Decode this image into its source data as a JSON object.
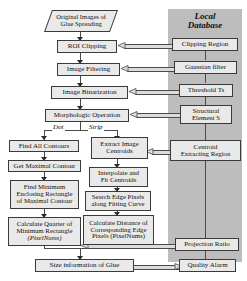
{
  "diagram": {
    "title_hidden": "",
    "panel": {
      "label_line1": "Local",
      "label_line2": "Database"
    },
    "branch_labels": {
      "left": "Dot",
      "right": "Strip"
    },
    "main_flow": [
      {
        "id": "original-images",
        "shape": "parallelogram",
        "lines": [
          "Original Images of",
          "Glue Spreading"
        ]
      },
      {
        "id": "roi-clipping",
        "shape": "process",
        "lines": [
          "ROI Clipping"
        ]
      },
      {
        "id": "image-filtering",
        "shape": "process",
        "lines": [
          "Image Filtering"
        ]
      },
      {
        "id": "image-binarization",
        "shape": "process",
        "lines": [
          "Image Binarization"
        ]
      },
      {
        "id": "morphologic-operation",
        "shape": "process",
        "lines": [
          "Morphologic Operation"
        ]
      }
    ],
    "left_branch": [
      {
        "id": "find-all-contours",
        "lines": [
          "Find All Contours"
        ]
      },
      {
        "id": "get-maximal-contour",
        "lines": [
          "Get Maximal Contour"
        ]
      },
      {
        "id": "find-minimum-enclosing-rectangle",
        "lines": [
          "Find Minimum",
          "Enclosing Rectangle",
          "of Maximal Contour"
        ]
      },
      {
        "id": "calculate-quarter-of-minimum-rectangle",
        "lines": [
          "Calculate Quarter of",
          "Minimum Rectangle",
          "(PixelNums)"
        ],
        "italic_tail": "(PixelNums)"
      }
    ],
    "right_branch": [
      {
        "id": "extract-image-centroids",
        "lines": [
          "Extract Image",
          "Centroids"
        ]
      },
      {
        "id": "interpolate-and-fit-centroids",
        "lines": [
          "Interpolate and",
          "Fit Centroids"
        ]
      },
      {
        "id": "search-edge-pixels",
        "lines": [
          "Search Edge Pixels",
          "along Fitting Curve"
        ]
      },
      {
        "id": "calculate-distance-of-edge-pixels",
        "lines": [
          "Calculate Distance of",
          "Corresponding Edge",
          "Pixels (PixelNums)"
        ]
      }
    ],
    "result": {
      "id": "size-information-of-glue",
      "lines": [
        "Size information of Glue"
      ]
    },
    "database_items": [
      {
        "id": "clipping-region",
        "lines": [
          "Clipping Region"
        ]
      },
      {
        "id": "gaussian-filter",
        "lines": [
          "Gaussian filter"
        ]
      },
      {
        "id": "threshold-ts",
        "lines": [
          "Threshold Ts"
        ],
        "italic_tail": "Ts"
      },
      {
        "id": "structural-element-s",
        "lines": [
          "Structural",
          "Element S"
        ],
        "italic_tail": "S"
      },
      {
        "id": "centroid-extracting-region",
        "lines": [
          "Centroid",
          "Extracting Region"
        ]
      },
      {
        "id": "projection-ratio",
        "lines": [
          "Projection Ratio"
        ]
      },
      {
        "id": "quality-alarm",
        "lines": [
          "Quality Alarm"
        ]
      }
    ],
    "colors": {
      "panel_gray": "#bdbdbd",
      "box_fill": "#e9e9e9",
      "box_border": "#3a3a3a",
      "connector": "#4a4a4a",
      "text": "#101010"
    }
  }
}
